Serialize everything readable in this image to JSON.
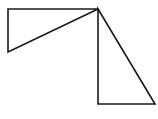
{
  "diagram": {
    "background": "#ffffff",
    "stroke_color": "#1a1a1a",
    "shapes": [
      {
        "name": "upper-left-triangle",
        "type": "right-triangle",
        "points": [
          [
            8,
            9
          ],
          [
            98,
            9
          ],
          [
            8,
            52
          ]
        ]
      },
      {
        "name": "lower-right-triangle",
        "type": "right-triangle",
        "points": [
          [
            98,
            9
          ],
          [
            98,
            104
          ],
          [
            155,
            104
          ]
        ]
      }
    ]
  }
}
